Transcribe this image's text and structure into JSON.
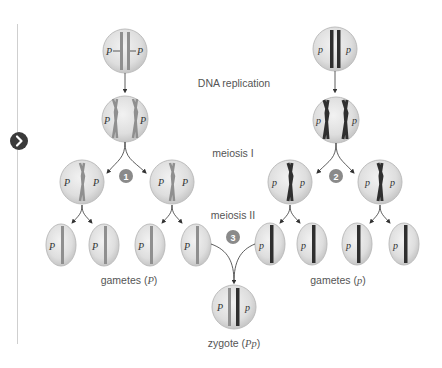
{
  "navigation": {
    "next_button_icon": "chevron-right-icon"
  },
  "stages": {
    "dna_replication": "DNA replication",
    "meiosis_1": "meiosis I",
    "meiosis_2": "meiosis II"
  },
  "outputs": {
    "gametes_P_prefix": "gametes (",
    "gametes_P_allele": "P",
    "gametes_p_prefix": "gametes (",
    "gametes_p_allele": "p",
    "zygote_prefix": "zygote (",
    "zygote_genotype": "Pp",
    "suffix": ")"
  },
  "steps": [
    "1",
    "2",
    "3"
  ],
  "alleles": {
    "dominant": "P",
    "recessive": "p"
  },
  "colors": {
    "cell_fill": "#dcdcdc",
    "cell_stroke": "#b8b8b8",
    "dominant_chromosome": "#8f8f8f",
    "recessive_chromosome": "#2f2f2f",
    "step_badge": "#8a8a8a",
    "nav_button": "#3a3a3a"
  }
}
